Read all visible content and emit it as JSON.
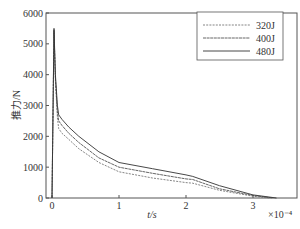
{
  "chart_data": {
    "type": "line",
    "title": "",
    "xlabel": "t/s",
    "ylabel": "推力/N",
    "x_multiplier_label": "×10⁻⁴",
    "xlim": [
      -0.08,
      3.65
    ],
    "ylim": [
      0,
      6000
    ],
    "xticks": [
      0,
      1,
      2,
      3
    ],
    "xtick_labels": [
      "0",
      "1",
      "2",
      "3"
    ],
    "yticks": [
      0,
      1000,
      2000,
      3000,
      4000,
      5000,
      6000
    ],
    "ytick_labels": [
      "0",
      "1000",
      "2000",
      "3000",
      "4000",
      "5000",
      "6000"
    ],
    "grid": false,
    "legend_position": "upper right",
    "series": [
      {
        "name": "320J",
        "style": "dashed",
        "color": "#777777",
        "x": [
          0,
          0.02,
          0.03,
          0.05,
          0.08,
          0.1,
          0.15,
          0.25,
          0.4,
          0.7,
          1.0,
          1.5,
          2.0,
          2.1,
          2.5,
          3.0,
          3.25
        ],
        "y": [
          0,
          3500,
          5400,
          3800,
          2600,
          2250,
          2100,
          1900,
          1600,
          1150,
          850,
          650,
          500,
          480,
          250,
          60,
          0
        ]
      },
      {
        "name": "400J",
        "style": "dotted-solid",
        "color": "#555555",
        "x": [
          0,
          0.02,
          0.03,
          0.05,
          0.08,
          0.1,
          0.15,
          0.25,
          0.4,
          0.7,
          1.0,
          1.5,
          2.0,
          2.1,
          2.5,
          3.0,
          3.3
        ],
        "y": [
          0,
          3500,
          5450,
          3900,
          2800,
          2500,
          2350,
          2100,
          1800,
          1300,
          1000,
          800,
          620,
          600,
          300,
          80,
          0
        ]
      },
      {
        "name": "480J",
        "style": "solid",
        "color": "#333333",
        "x": [
          0,
          0.02,
          0.03,
          0.05,
          0.08,
          0.1,
          0.15,
          0.25,
          0.4,
          0.7,
          1.0,
          1.5,
          2.0,
          2.1,
          2.5,
          3.0,
          3.35
        ],
        "y": [
          0,
          3600,
          5500,
          4000,
          3000,
          2700,
          2550,
          2300,
          2000,
          1500,
          1150,
          950,
          750,
          700,
          400,
          100,
          0
        ]
      }
    ]
  }
}
